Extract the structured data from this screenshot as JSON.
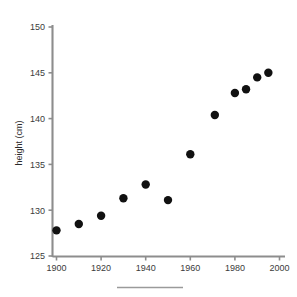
{
  "chart_data": {
    "type": "scatter",
    "title": "",
    "subtitle": "",
    "xlabel": "",
    "ylabel": "height (cm)",
    "xlim": [
      1895,
      2005
    ],
    "ylim": [
      125,
      150
    ],
    "grid": false,
    "legend": null,
    "x_ticks": [
      1900,
      1920,
      1940,
      1960,
      1980,
      2000
    ],
    "x_tick_labels": [
      "1900",
      "1920",
      "1940",
      "1960",
      "1980",
      "2000"
    ],
    "x_minor_ticks": [
      1910,
      1930,
      1950,
      1970,
      1990
    ],
    "y_ticks": [
      125,
      130,
      135,
      140,
      145,
      150
    ],
    "y_tick_labels": [
      "125",
      "130",
      "135",
      "140",
      "145",
      "150"
    ],
    "marker": "circle",
    "marker_color": "#111111",
    "marker_size": 4.2,
    "x": [
      1900,
      1910,
      1920,
      1930,
      1940,
      1950,
      1960,
      1971,
      1980,
      1985,
      1990,
      1995
    ],
    "y": [
      127.8,
      128.5,
      129.4,
      131.3,
      132.8,
      131.1,
      136.1,
      140.4,
      142.8,
      143.2,
      144.5,
      145.0
    ],
    "points": [
      {
        "x": 1900,
        "y": 127.8
      },
      {
        "x": 1910,
        "y": 128.5
      },
      {
        "x": 1920,
        "y": 129.4
      },
      {
        "x": 1930,
        "y": 131.3
      },
      {
        "x": 1940,
        "y": 132.8
      },
      {
        "x": 1950,
        "y": 131.1
      },
      {
        "x": 1960,
        "y": 136.1
      },
      {
        "x": 1971,
        "y": 140.4
      },
      {
        "x": 1980,
        "y": 142.8
      },
      {
        "x": 1985,
        "y": 143.2
      },
      {
        "x": 1990,
        "y": 144.5
      },
      {
        "x": 1995,
        "y": 145.0
      }
    ]
  },
  "axes": {
    "y_label": "height (cm)",
    "y_tick_150": "150",
    "y_tick_145": "145",
    "y_tick_140": "140",
    "y_tick_135": "135",
    "y_tick_130": "130",
    "y_tick_125": "125",
    "x_tick_1900": "1900",
    "x_tick_1920": "1920",
    "x_tick_1940": "1940",
    "x_tick_1960": "1960",
    "x_tick_1980": "1980",
    "x_tick_2000": "2000"
  },
  "colors": {
    "marker": "#111111",
    "axis": "#8d8d8d",
    "text": "#3b3b3b",
    "background": "#ffffff",
    "footer_rule": "#9a9a9a"
  }
}
